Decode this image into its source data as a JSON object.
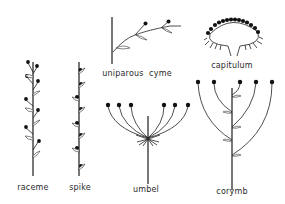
{
  "figure": {
    "background": "#ffffff",
    "ink_color": "#222222"
  },
  "inflorescences": [
    {
      "id": "raceme",
      "label": "raceme",
      "label_x": 33,
      "label_y": 183
    },
    {
      "id": "spike",
      "label": "spike",
      "label_x": 80,
      "label_y": 183
    },
    {
      "id": "uniparous-cyme",
      "label": "uniparous  cyme",
      "label_x": 137,
      "label_y": 71
    },
    {
      "id": "capitulum",
      "label": "capitulum",
      "label_x": 232,
      "label_y": 63
    },
    {
      "id": "umbel",
      "label": "umbel",
      "label_x": 146,
      "label_y": 186
    },
    {
      "id": "corymb",
      "label": "corymb",
      "label_x": 232,
      "label_y": 188
    }
  ]
}
